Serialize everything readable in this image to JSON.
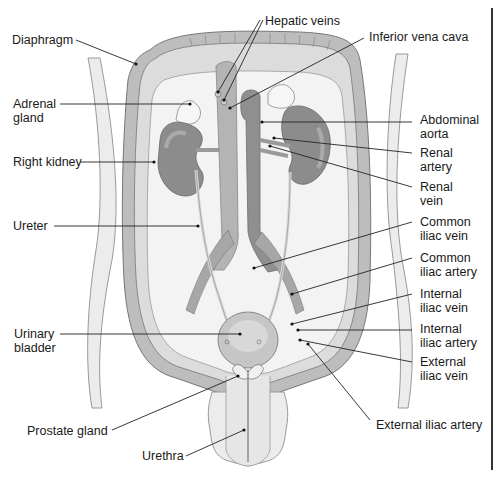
{
  "diagram": {
    "colors": {
      "background": "#ffffff",
      "body_fill": "#e9e9e9",
      "cavity_fill": "#f4f4f4",
      "wall_dark": "#a8a8a8",
      "organ_dark": "#8c8c8c",
      "organ_mid": "#b0b0b0",
      "leader_line": "#222222",
      "label_text": "#1a1a1a"
    },
    "labels": {
      "left": [
        {
          "id": "diaphragm",
          "text": "Diaphragm"
        },
        {
          "id": "adrenal_gland",
          "text_line1": "Adrenal",
          "text_line2": "gland"
        },
        {
          "id": "right_kidney",
          "text": "Right kidney"
        },
        {
          "id": "ureter",
          "text": "Ureter"
        },
        {
          "id": "urinary_bladder",
          "text_line1": "Urinary",
          "text_line2": "bladder"
        },
        {
          "id": "prostate_gland",
          "text": "Prostate gland"
        },
        {
          "id": "urethra",
          "text": "Urethra"
        }
      ],
      "top": [
        {
          "id": "hepatic_veins",
          "text": "Hepatic veins"
        },
        {
          "id": "inferior_vena_cava",
          "text": "Inferior vena cava"
        }
      ],
      "right": [
        {
          "id": "abdominal_aorta",
          "text_line1": "Abdominal",
          "text_line2": "aorta"
        },
        {
          "id": "renal_artery",
          "text_line1": "Renal",
          "text_line2": "artery"
        },
        {
          "id": "renal_vein",
          "text_line1": "Renal",
          "text_line2": "vein"
        },
        {
          "id": "common_iliac_vein",
          "text_line1": "Common",
          "text_line2": "iliac vein"
        },
        {
          "id": "common_iliac_artery",
          "text_line1": "Common",
          "text_line2": "iliac artery"
        },
        {
          "id": "internal_iliac_vein",
          "text_line1": "Internal",
          "text_line2": "iliac vein"
        },
        {
          "id": "internal_iliac_artery",
          "text_line1": "Internal",
          "text_line2": "iliac artery"
        },
        {
          "id": "external_iliac_vein",
          "text_line1": "External",
          "text_line2": "iliac vein"
        },
        {
          "id": "external_iliac_artery",
          "text": "External iliac artery"
        }
      ]
    }
  }
}
